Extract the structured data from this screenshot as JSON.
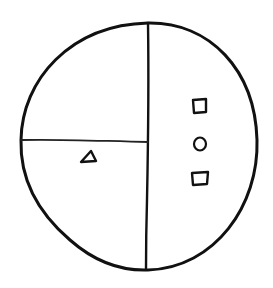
{
  "diagram": {
    "type": "hand-drawn partitioned circle",
    "background": "#ffffff",
    "stroke_color": "#111111",
    "outer_circle": {
      "cx": 139,
      "cy": 146,
      "rx": 119,
      "ry": 124
    },
    "dividers": [
      {
        "name": "vertical-divider",
        "x1": 148,
        "y1": 23,
        "x2": 146,
        "y2": 269
      },
      {
        "name": "horizontal-divider",
        "x1": 21,
        "y1": 140,
        "x2": 148,
        "y2": 142
      }
    ],
    "regions": [
      {
        "name": "top-left-quarter",
        "contents": []
      },
      {
        "name": "bottom-left-quarter",
        "contents": [
          "triangle"
        ]
      },
      {
        "name": "right-half",
        "contents": [
          "square",
          "circle",
          "square"
        ]
      }
    ],
    "shapes": [
      {
        "kind": "triangle",
        "x": 88,
        "y": 157,
        "size": 14
      },
      {
        "kind": "square",
        "x": 200,
        "y": 106,
        "size": 13
      },
      {
        "kind": "circle",
        "x": 200,
        "y": 144,
        "r": 6
      },
      {
        "kind": "square",
        "x": 199,
        "y": 178,
        "size": 13
      }
    ]
  }
}
